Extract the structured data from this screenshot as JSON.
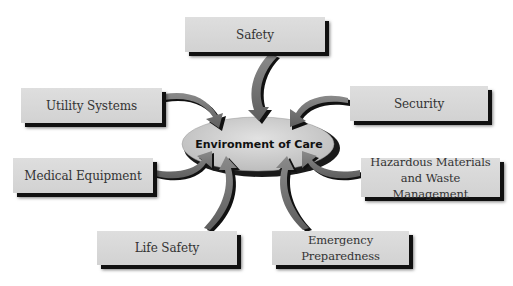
{
  "diagram": {
    "center": {
      "label": "Environment of Care"
    },
    "nodes": [
      {
        "id": "safety",
        "label": "Safety"
      },
      {
        "id": "utility-systems",
        "label": "Utility Systems"
      },
      {
        "id": "security",
        "label": "Security"
      },
      {
        "id": "medical-equipment",
        "label": "Medical Equipment"
      },
      {
        "id": "hazardous-materials",
        "label": "Hazardous Materials and Waste Management"
      },
      {
        "id": "life-safety",
        "label": "Life Safety"
      },
      {
        "id": "emergency-preparedness",
        "label": "Emergency Preparedness"
      }
    ],
    "colors": {
      "box_fill": "#d8d8d8",
      "box_shadow": "#111111",
      "arrow_fill": "#7a7a7a",
      "ellipse_fill": "#cfcfcf",
      "text": "#333333"
    }
  }
}
